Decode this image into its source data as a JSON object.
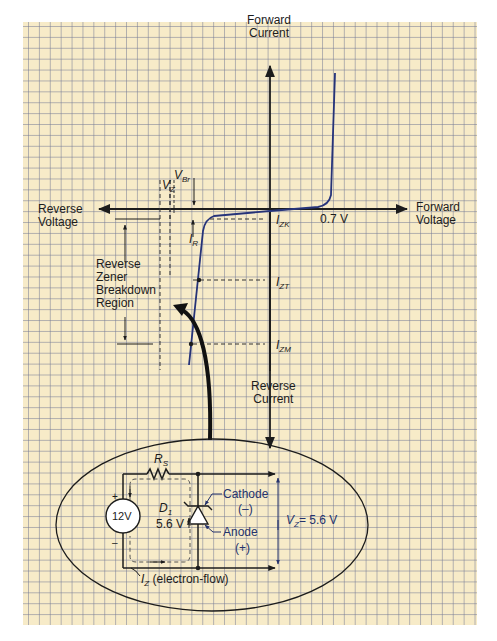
{
  "axes": {
    "forward_current": [
      "Forward",
      "Current"
    ],
    "forward_voltage": [
      "Forward",
      "Voltage"
    ],
    "reverse_voltage": [
      "Reverse",
      "Voltage"
    ],
    "reverse_current": [
      "Reverse",
      "Current"
    ]
  },
  "markers": {
    "forward_knee": "0.7 V",
    "vz_main": "V",
    "vz_sub": "Z",
    "vbr_main": "V",
    "vbr_sub": "Br",
    "ir_main": "I",
    "ir_sub": "R",
    "izk_main": "I",
    "izk_sub": "ZK",
    "izt_main": "I",
    "izt_sub": "ZT",
    "izm_main": "I",
    "izm_sub": "ZM"
  },
  "region_label": [
    "Reverse",
    "Zener",
    "Breakdown",
    "Region"
  ],
  "circuit": {
    "resistor_main": "R",
    "resistor_sub": "S",
    "source": "12V",
    "source_plus": "+",
    "source_minus": "–",
    "diode_main": "D",
    "diode_sub": "1",
    "diode_voltage": "5.6 V",
    "cathode": "Cathode",
    "cathode_sign": "(–)",
    "anode": "Anode",
    "anode_sign": "(+)",
    "vz_main": "V",
    "vz_sub": "Z",
    "vz_value": "= 5.6 V",
    "current_main": "I",
    "current_sub": "Z",
    "current_note": "(electron-flow)"
  },
  "colors": {
    "paper": "#f7ebc8",
    "grid": "#7d8296",
    "curve": "#2a3a8c",
    "ink": "#1c1c1c",
    "label_blue": "#25336d"
  }
}
